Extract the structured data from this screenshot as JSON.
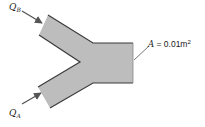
{
  "diagram": {
    "inlet_b": {
      "label": "Q",
      "subscript": "B"
    },
    "inlet_a": {
      "label": "Q",
      "subscript": "A"
    },
    "outlet": {
      "label_var": "A",
      "label_eq": " = 0.01m",
      "label_exp": "2"
    },
    "colors": {
      "pipe_fill": "#bdbdbd",
      "pipe_edge": "#3a3a3a",
      "arrow": "#555555",
      "text": "#222222"
    }
  }
}
